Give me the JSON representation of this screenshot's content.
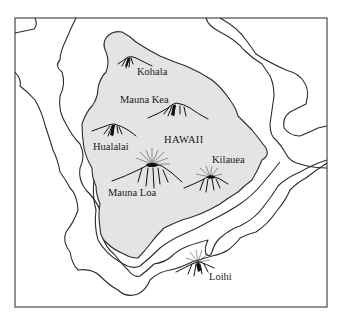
{
  "map": {
    "island_name": "HAWAII",
    "volcanoes": [
      {
        "name": "Kohala",
        "label": "Kohala"
      },
      {
        "name": "Mauna Kea",
        "label": "Mauna Kea"
      },
      {
        "name": "Hualalai",
        "label": "Hualalai"
      },
      {
        "name": "Mauna Loa",
        "label": "Mauna Loa"
      },
      {
        "name": "Kilauea",
        "label": "Kilauea"
      },
      {
        "name": "Loihi",
        "label": "Loihi"
      }
    ],
    "colors": {
      "island_fill": "#e4e4e4",
      "line": "#2b2b2b",
      "background": "#ffffff"
    }
  }
}
